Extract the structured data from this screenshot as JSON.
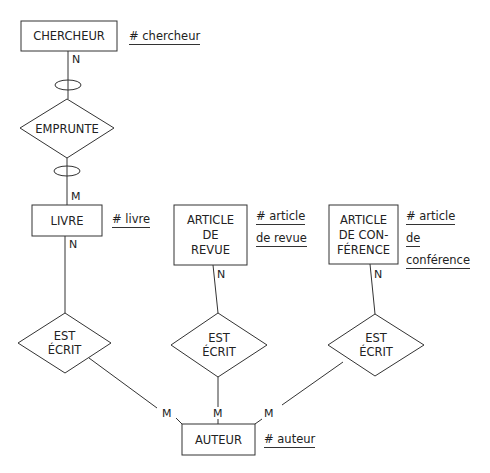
{
  "entities": [
    {
      "id": "chercheur",
      "lines": [
        "CHERCHEUR"
      ],
      "identifier": [
        "# chercheur"
      ]
    },
    {
      "id": "livre",
      "lines": [
        "LIVRE"
      ],
      "identifier": [
        "# livre"
      ]
    },
    {
      "id": "article_revue",
      "lines": [
        "ARTICLE",
        "DE",
        "REVUE"
      ],
      "identifier": [
        "# article",
        "de revue"
      ]
    },
    {
      "id": "article_conference",
      "lines": [
        "ARTICLE",
        "DE CON-",
        "FÉRENCE"
      ],
      "identifier": [
        "# article",
        "de",
        "conférence"
      ]
    },
    {
      "id": "auteur",
      "lines": [
        "AUTEUR"
      ],
      "identifier": [
        "# auteur"
      ]
    }
  ],
  "relations": [
    {
      "id": "emprunte",
      "lines": [
        "EMPRUNTE"
      ]
    },
    {
      "id": "est_ecrit_1",
      "lines": [
        "EST",
        "ÉCRIT"
      ]
    },
    {
      "id": "est_ecrit_2",
      "lines": [
        "EST",
        "ÉCRIT"
      ]
    },
    {
      "id": "est_ecrit_3",
      "lines": [
        "EST",
        "ÉCRIT"
      ]
    }
  ],
  "cardinalities": {
    "chercheur_emprunte": "N",
    "emprunte_livre": "M",
    "livre_ecrit": "N",
    "revue_ecrit": "N",
    "conf_ecrit": "N",
    "auteur_1": "M",
    "auteur_2": "M",
    "auteur_3": "M"
  }
}
